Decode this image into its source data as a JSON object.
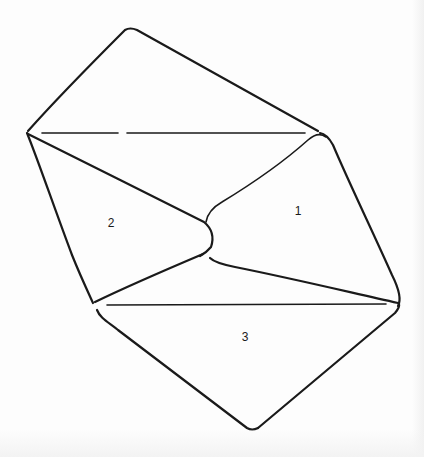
{
  "diagram": {
    "stroke_color": "#1a1a1a",
    "background_color": "#fdfdfd",
    "labels": [
      {
        "id": "face-1",
        "text": "1",
        "x": 298,
        "y": 211
      },
      {
        "id": "face-2",
        "text": "2",
        "x": 111,
        "y": 223
      },
      {
        "id": "face-3",
        "text": "3",
        "x": 245,
        "y": 337
      }
    ],
    "vertices": {
      "top": [
        128,
        28
      ],
      "left": [
        27,
        133
      ],
      "right_upper": [
        320,
        133
      ],
      "waist": [
        212,
        228
      ],
      "bottom_left": [
        93,
        303
      ],
      "right_lower": [
        400,
        304
      ],
      "bottom": [
        252,
        430
      ]
    }
  }
}
